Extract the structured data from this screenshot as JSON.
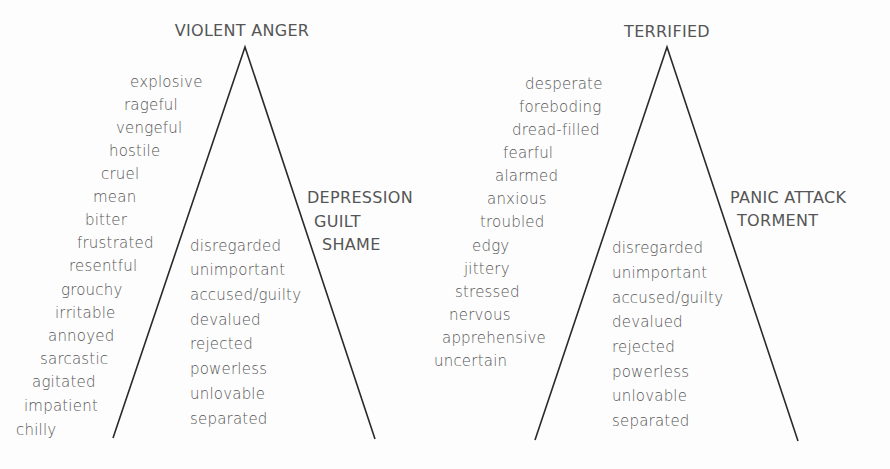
{
  "colors": {
    "text": "#555555",
    "line": "#2a2a2a",
    "background": "#fdfdfd"
  },
  "pyramids": [
    {
      "title": "VIOLENT ANGER",
      "side_labels": [
        "DEPRESSION",
        "GUILT",
        "SHAME"
      ],
      "outer_words": [
        "explosive",
        "rageful",
        "vengeful",
        "hostile",
        "cruel",
        "mean",
        "bitter",
        "frustrated",
        "resentful",
        "grouchy",
        "irritable",
        "annoyed",
        "sarcastic",
        "agitated",
        "impatient",
        "chilly"
      ],
      "inner_words": [
        "disregarded",
        "unimportant",
        "accused/guilty",
        "devalued",
        "rejected",
        "powerless",
        "unlovable",
        "separated"
      ]
    },
    {
      "title": "TERRIFIED",
      "side_labels": [
        "PANIC ATTACK",
        "TORMENT"
      ],
      "outer_words": [
        "desperate",
        "foreboding",
        "dread-filled",
        "fearful",
        "alarmed",
        "anxious",
        "troubled",
        "edgy",
        "jittery",
        "stressed",
        "nervous",
        "apprehensive",
        "uncertain"
      ],
      "inner_words": [
        "disregarded",
        "unimportant",
        "accused/guilty",
        "devalued",
        "rejected",
        "powerless",
        "unlovable",
        "separated"
      ]
    }
  ]
}
